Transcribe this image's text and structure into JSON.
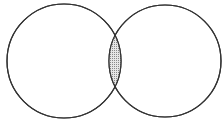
{
  "diagram": {
    "type": "venn",
    "sets": [
      {
        "name": "set-a",
        "cx": 64,
        "cy": 61,
        "r": 57
      },
      {
        "name": "set-b",
        "cx": 165,
        "cy": 61,
        "r": 56
      }
    ],
    "intersection": {
      "shaded": true,
      "pattern": "dots"
    },
    "colors": {
      "stroke": "#333333",
      "fill": "#ffffff",
      "shade": "#bdbdbd"
    }
  }
}
